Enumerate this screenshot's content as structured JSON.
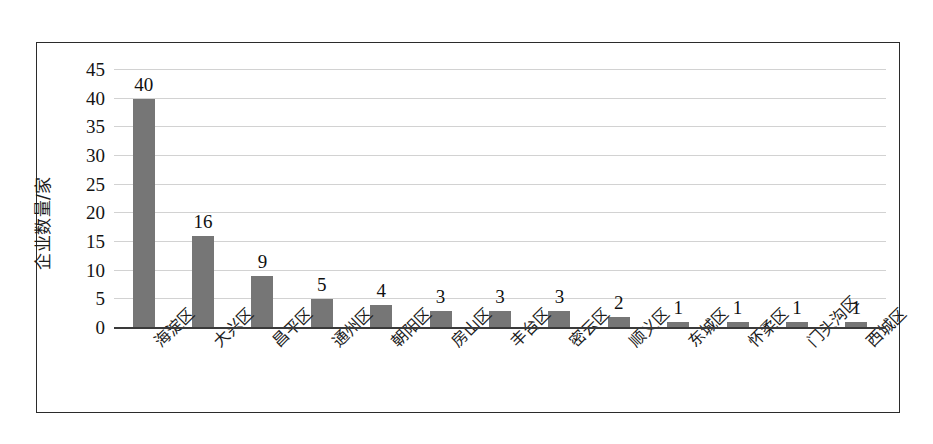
{
  "chart_data": {
    "type": "bar",
    "title": "",
    "xlabel": "",
    "ylabel": "企业数量/家",
    "categories": [
      "海淀区",
      "大兴区",
      "昌平区",
      "通州区",
      "朝阳区",
      "房山区",
      "丰台区",
      "密云区",
      "顺义区",
      "东城区",
      "怀柔区",
      "门头沟区",
      "西城区"
    ],
    "values": [
      40,
      16,
      9,
      5,
      4,
      3,
      3,
      3,
      2,
      1,
      1,
      1,
      1
    ],
    "data_labels": [
      "40",
      "16",
      "9",
      "5",
      "4",
      "3",
      "3",
      "3",
      "2",
      "1",
      "1",
      "1",
      "1"
    ],
    "ylim": [
      0,
      45
    ],
    "ytick_values": [
      0,
      5,
      10,
      15,
      20,
      25,
      30,
      35,
      40,
      45
    ],
    "ytick_labels": [
      "0",
      "5",
      "10",
      "15",
      "20",
      "25",
      "30",
      "35",
      "40",
      "45"
    ],
    "grid": true,
    "grid_axis": "y",
    "legend": false,
    "bar_color": "#767676",
    "grid_color": "#d2d2d2",
    "axis_color": "#3a3a3a",
    "border_color": "#2b2b2b",
    "background": "#ffffff"
  }
}
